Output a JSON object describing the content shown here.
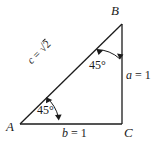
{
  "figure": {
    "kind": "geometry-diagram",
    "background_color": "#ffffff",
    "line_color": "#1b1b1b",
    "text_color": "#1b1b1b",
    "vertices": [
      {
        "name": "vertex-b",
        "label": "B",
        "x": 122,
        "y": 24
      },
      {
        "name": "vertex-a",
        "label": "A",
        "x": 20,
        "y": 124
      },
      {
        "name": "vertex-c",
        "label": "C",
        "x": 122,
        "y": 124
      }
    ],
    "sides": [
      {
        "name": "side-a",
        "var": "a",
        "eq": " = ",
        "value": "1",
        "full": "a = 1"
      },
      {
        "name": "side-b",
        "var": "b",
        "eq": " = ",
        "value": "1",
        "full": "b = 1"
      },
      {
        "name": "side-c",
        "var": "c",
        "eq": " = ",
        "radical": "√",
        "value": "2",
        "full": "c = √2"
      }
    ],
    "angles": [
      {
        "name": "angle-at-b",
        "label": "45°",
        "position": "upper-right"
      },
      {
        "name": "angle-at-a",
        "label": "45°",
        "position": "lower-left"
      }
    ]
  }
}
